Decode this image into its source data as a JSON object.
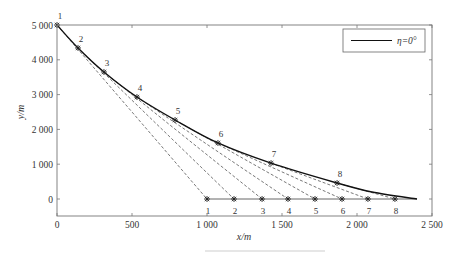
{
  "chart_data": {
    "type": "line",
    "title": "",
    "xlabel": "x/m",
    "ylabel": "y/m",
    "xlim": [
      0,
      2500
    ],
    "ylim": [
      -300,
      5000
    ],
    "x_ticks": [
      0,
      500,
      1000,
      1500,
      2000,
      2500
    ],
    "x_tick_labels": [
      "0",
      "500",
      "1 000",
      "1 500",
      "2 000",
      "2 500"
    ],
    "y_ticks": [
      0,
      1000,
      2000,
      3000,
      4000,
      5000
    ],
    "y_tick_labels": [
      "0",
      "1 000",
      "2 000",
      "3 000",
      "4 000",
      "5 000"
    ],
    "grid": false,
    "legend": {
      "position": "upper right",
      "entries": [
        "η=0°"
      ]
    },
    "series": [
      {
        "name": "η=0°",
        "style": "solid",
        "x": [
          0,
          140,
          313,
          533,
          787,
          1073,
          1427,
          1867,
          2100,
          2400
        ],
        "y": [
          5000,
          4340,
          3650,
          2930,
          2270,
          1610,
          1030,
          460,
          200,
          0
        ]
      }
    ],
    "trajectory_points": [
      {
        "label": "1",
        "x": 0,
        "y": 5000
      },
      {
        "label": "2",
        "x": 140,
        "y": 4340
      },
      {
        "label": "3",
        "x": 313,
        "y": 3650
      },
      {
        "label": "4",
        "x": 533,
        "y": 2930
      },
      {
        "label": "5",
        "x": 787,
        "y": 2270
      },
      {
        "label": "6",
        "x": 1073,
        "y": 1610
      },
      {
        "label": "7",
        "x": 1427,
        "y": 1030
      },
      {
        "label": "8",
        "x": 1867,
        "y": 460
      }
    ],
    "ground_points": [
      {
        "label": "1",
        "x": 1000,
        "y": 0
      },
      {
        "label": "2",
        "x": 1180,
        "y": 0
      },
      {
        "label": "3",
        "x": 1367,
        "y": 0
      },
      {
        "label": "4",
        "x": 1540,
        "y": 0
      },
      {
        "label": "5",
        "x": 1720,
        "y": 0
      },
      {
        "label": "6",
        "x": 1900,
        "y": 0
      },
      {
        "label": "7",
        "x": 2073,
        "y": 0
      },
      {
        "label": "8",
        "x": 2253,
        "y": 0
      }
    ],
    "annotations": "Dashed lines connect each trajectory point i to ground point i; solid horizontal line along y=0 from x=1000 to x≈2400"
  },
  "colors": {
    "curve": "#111111",
    "dashed": "#555555",
    "axis": "#777777",
    "text": "#333333"
  }
}
